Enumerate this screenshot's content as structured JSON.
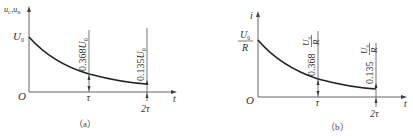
{
  "figure": {
    "panels": [
      {
        "id": "a",
        "caption": "（a）",
        "y_axis_label": "uC, uR",
        "y_axis_label_main": "u",
        "y_axis_label_sub1": "C",
        "y_axis_label_sep": ",",
        "y_axis_label_main2": "u",
        "y_axis_label_sub2": "R",
        "x_axis_label": "t",
        "origin_label": "O",
        "initial_value_label": "U0",
        "initial_value_main": "U",
        "initial_value_sub": "0",
        "tick_tau": "τ",
        "tick_2tau": "2τ",
        "annotation_tau": "0.368U0",
        "annotation_tau_num": "0.368",
        "annotation_tau_main": "U",
        "annotation_tau_sub": "0",
        "annotation_2tau": "0.135U0",
        "annotation_2tau_num": "0.135",
        "annotation_2tau_main": "U",
        "annotation_2tau_sub": "0"
      },
      {
        "id": "b",
        "caption": "（b）",
        "y_axis_label": "i",
        "x_axis_label": "t",
        "origin_label": "O",
        "initial_value_label": "U0/R",
        "initial_value_num_main": "U",
        "initial_value_num_sub": "0",
        "initial_value_den": "R",
        "tick_tau": "τ",
        "tick_2tau": "2τ",
        "annotation_tau": "0.368 U0/R",
        "annotation_tau_num": "0.368",
        "annotation_tau_frac_main": "U",
        "annotation_tau_frac_sub": "0",
        "annotation_tau_frac_den": "R",
        "annotation_2tau": "0.135 U0/R",
        "annotation_2tau_num": "0.135",
        "annotation_2tau_frac_main": "U",
        "annotation_2tau_frac_sub": "0",
        "annotation_2tau_frac_den": "R"
      }
    ],
    "colors": {
      "curve": "#222222",
      "axis": "#555555",
      "text": "#333333",
      "background": "#ffffff"
    }
  }
}
